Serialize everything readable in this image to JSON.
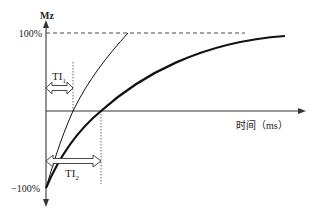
{
  "diagram": {
    "y_axis_label": "Mz",
    "x_axis_label": "时间（ms）",
    "tick_top": "100%",
    "tick_bottom": "−100%",
    "ti1_label": "TI",
    "ti1_sub": "1",
    "ti2_label": "TI",
    "ti2_sub": "2",
    "colors": {
      "axis": "#333333",
      "curve": "#111111",
      "dashed": "#333333",
      "arrow_fill": "#ffffff"
    },
    "curves": [
      {
        "name": "fast-recovery",
        "weight": "thin"
      },
      {
        "name": "slow-recovery",
        "weight": "thick"
      }
    ]
  }
}
